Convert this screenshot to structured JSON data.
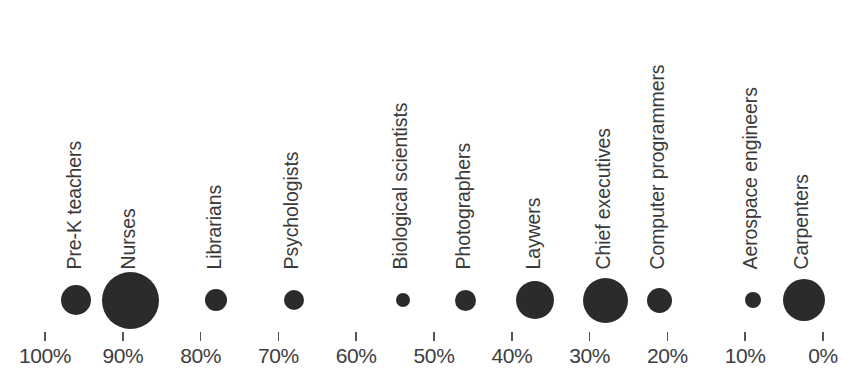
{
  "chart_data": {
    "type": "scatter",
    "title": "",
    "subtitle": "",
    "xlabel": "",
    "ylabel": "",
    "xlim": [
      100,
      0
    ],
    "x_axis_reversed": true,
    "grid": false,
    "legend": null,
    "legend_position": "none",
    "bubble_color": "#2b2b2b",
    "axis_text_color": "#3d3d3d",
    "label_text_color": "#3a3a3a",
    "background_color": "#ffffff",
    "xtick_labels": [
      "100%",
      "90%",
      "80%",
      "70%",
      "60%",
      "50%",
      "40%",
      "30%",
      "20%",
      "10%",
      "0%"
    ],
    "xticks": [
      100,
      90,
      80,
      70,
      60,
      50,
      40,
      30,
      20,
      10,
      0
    ],
    "categories": [
      "Pre-K teachers",
      "Nurses",
      "Librarians",
      "Psychologists",
      "Biological scientists",
      "Photographers",
      "Laywers",
      "Chief executives",
      "Computer programmers",
      "Aerospace engineers",
      "Carpenters"
    ],
    "x": [
      96,
      89,
      78,
      68,
      54,
      46,
      37,
      28,
      21,
      9,
      2.5
    ],
    "bubble_diameters_px": [
      30,
      57,
      22,
      20,
      14,
      21,
      38,
      45,
      25,
      16,
      42
    ],
    "points": [
      {
        "label": "Pre-K teachers",
        "x": 96,
        "size": 30
      },
      {
        "label": "Nurses",
        "x": 89,
        "size": 57
      },
      {
        "label": "Librarians",
        "x": 78,
        "size": 22
      },
      {
        "label": "Psychologists",
        "x": 68,
        "size": 20
      },
      {
        "label": "Biological scientists",
        "x": 54,
        "size": 14
      },
      {
        "label": "Photographers",
        "x": 46,
        "size": 21
      },
      {
        "label": "Laywers",
        "x": 37,
        "size": 38
      },
      {
        "label": "Chief executives",
        "x": 28,
        "size": 45
      },
      {
        "label": "Computer programmers",
        "x": 21,
        "size": 25
      },
      {
        "label": "Aerospace engineers",
        "x": 9,
        "size": 16
      },
      {
        "label": "Carpenters",
        "x": 2.5,
        "size": 42
      }
    ]
  },
  "layout": {
    "axis_left_px": 45,
    "axis_right_px": 823,
    "baseline_y_px": 332,
    "bubble_center_y_px": 300,
    "tick_label_y_px": 345,
    "label_bottom_y_px": 268
  }
}
